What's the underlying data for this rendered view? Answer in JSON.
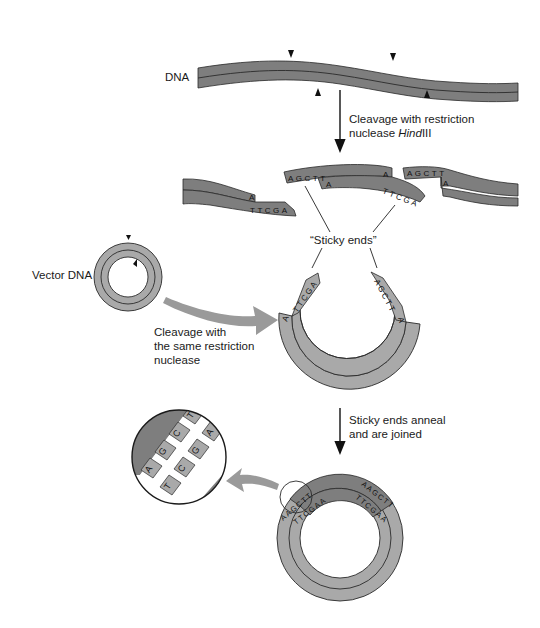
{
  "colors": {
    "dark_strand": "#7e7e7e",
    "light_strand": "#a9a9a9",
    "outline": "#2a2a2a",
    "arrow_gray": "#9a9a9a",
    "background": "#ffffff"
  },
  "labels": {
    "dna": "DNA",
    "step1_line1": "Cleavage with restriction",
    "step1_line2_prefix": "nuclease ",
    "step1_enzyme_italic": "Hind",
    "step1_enzyme_suffix": "III",
    "sticky_ends": "“Sticky ends”",
    "vector_dna": "Vector DNA",
    "step2_line1": "Cleavage with",
    "step2_line2": "the same restriction",
    "step2_line3": "nuclease",
    "step3_line1": "Sticky ends anneal",
    "step3_line2": "and are joined"
  },
  "sequences": {
    "top_overhang": "AGCTT",
    "bottom_overhang": "TTCGA",
    "single_base_top": "A",
    "single_base_bottom": "A"
  },
  "magnified_view": {
    "top_strand_bases": [
      "A",
      "G",
      "C",
      "T"
    ],
    "bottom_strand_bases": [
      "T",
      "C",
      "G",
      "A"
    ]
  }
}
